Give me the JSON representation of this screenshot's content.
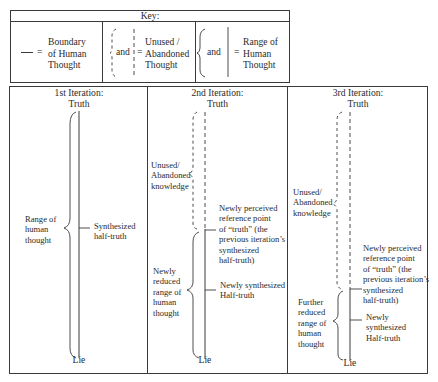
{
  "key": {
    "title": "Key:",
    "items": [
      {
        "symbol": "solid-line",
        "equals": "=",
        "label": "Boundary\nof Human\nThought"
      },
      {
        "symbol": "dashed-brace-and-dashed-line",
        "and": "and",
        "equals": "=",
        "label": "Unused /\nAbandoned\nThought"
      },
      {
        "symbol": "solid-brace-and-solid-line",
        "and": "and",
        "equals": "=",
        "label": "Range of\nHuman\nThought"
      }
    ]
  },
  "iterations": [
    {
      "title": "1st Iteration:",
      "top_label": "Truth",
      "bottom_label": "Lie",
      "brace_label": "Range of\nhuman\nthought",
      "tick_labels": [
        "Synthesized\nhalf-truth"
      ]
    },
    {
      "title": "2nd Iteration:",
      "top_label": "Truth",
      "bottom_label": "Lie",
      "unused_label": "Unused/\nAbandoned\nknowledge",
      "brace_label": "Newly\nreduced\nrange of\nhuman\nthought",
      "tick_labels": [
        "Newly perceived\nreference point\nof “truth” (the\nprevious iteration’s\nsynthesized\nhalf-truth)",
        "Newly synthesized\nHalf-truth"
      ]
    },
    {
      "title": "3rd Iteration:",
      "top_label": "Truth",
      "bottom_label": "Lie",
      "unused_label": "Unused/\nAbandoned\nknowledge",
      "brace_label": "Further\nreduced\nrange of\nhuman\nthought",
      "tick_labels": [
        "Newly perceived\nreference point\nof “truth” (the\nprevious iteration’s\nsynthesized\nhalf-truth)",
        "Newly\nsynthesized\nHalf-truth"
      ]
    }
  ]
}
